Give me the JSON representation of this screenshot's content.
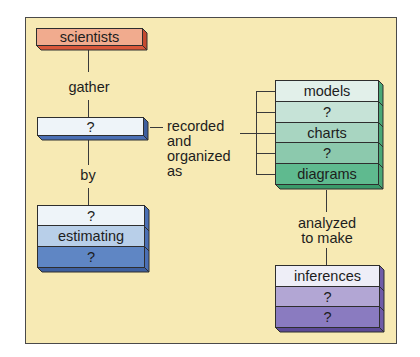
{
  "diagram": {
    "background_color": "#f7eab4",
    "nodes": {
      "scientists": {
        "rows": [
          {
            "label": "scientists",
            "color": "#f1ab8e"
          }
        ],
        "depth_color": "#d9573a"
      },
      "gathered": {
        "rows": [
          {
            "label": "?",
            "color": "#eef4f9"
          }
        ],
        "depth_color": "#4a6fb5"
      },
      "methods": {
        "rows": [
          {
            "label": "?",
            "color": "#eef4f9"
          },
          {
            "label": "estimating",
            "color": "#b8cfe9"
          },
          {
            "label": "?",
            "color": "#5f86c4"
          }
        ],
        "depth_color": "#3e5f9e"
      },
      "representations": {
        "rows": [
          {
            "label": "models",
            "color": "#e2f0ea"
          },
          {
            "label": "?",
            "color": "#c6e3d7"
          },
          {
            "label": "charts",
            "color": "#a8d5c1"
          },
          {
            "label": "?",
            "color": "#8cc9ad"
          },
          {
            "label": "diagrams",
            "color": "#5fba8f"
          }
        ],
        "depth_color": "#3a9a6a"
      },
      "conclusions": {
        "rows": [
          {
            "label": "inferences",
            "color": "#eeeef7"
          },
          {
            "label": "?",
            "color": "#b2a6d4"
          },
          {
            "label": "?",
            "color": "#8a7bc0"
          }
        ],
        "depth_color": "#5c4a96"
      }
    },
    "links": {
      "gather": "gather",
      "by": "by",
      "recorded": [
        "recorded",
        "and",
        "organized",
        "as"
      ],
      "analyzed": [
        "analyzed",
        "to make"
      ]
    }
  }
}
